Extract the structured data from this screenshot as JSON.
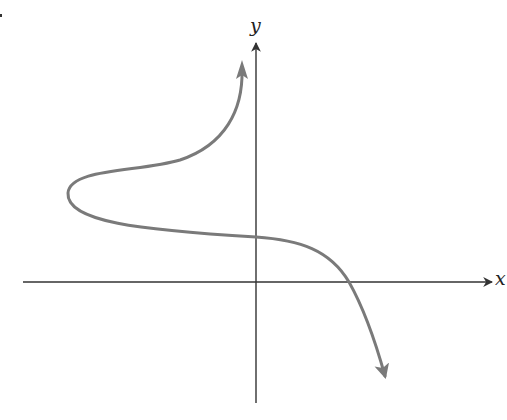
{
  "diagram": {
    "type": "function-curve-sketch",
    "axes": {
      "x_label": "x",
      "y_label": "y",
      "origin_px": [
        256,
        282
      ],
      "x_axis_px": {
        "x_start": 23,
        "x_end": 494,
        "y": 282
      },
      "y_axis_px": {
        "x": 256,
        "y_start": 403,
        "y_end": 42
      },
      "color": "#333333"
    },
    "curve": {
      "color": "#7a7a7a",
      "stroke_width": 3,
      "description": "Curve starting at upper arrow, bulging left to an S-shape, crossing positive y-axis and positive x-axis, ending with downward arrow",
      "path": "M 242 70 C 243 110, 225 145, 180 160 C 140 172, 70 168, 68 193 C 66 222, 140 230, 256 237 C 300 240, 330 250, 349 282 C 362 305, 375 340, 385 376",
      "start_arrow_tip": [
        242,
        62
      ],
      "end_arrow_tip": [
        387,
        384
      ],
      "leftmost_point": [
        68,
        193
      ],
      "y_intercept_px": [
        256,
        237
      ],
      "x_intercept_px": [
        349,
        282
      ]
    }
  }
}
